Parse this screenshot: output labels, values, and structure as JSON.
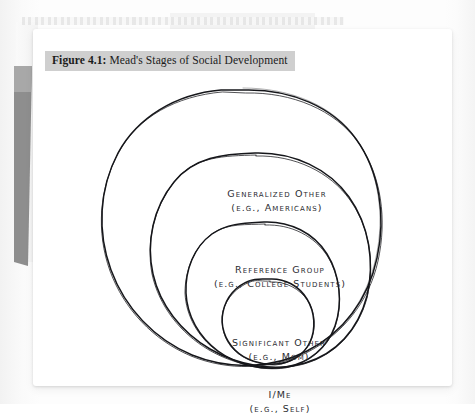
{
  "document": {
    "type": "textbook-page-scan",
    "page_background": "#ffffff",
    "scan_background": "#fdfdfd"
  },
  "caption": {
    "number": "Figure 4.1:",
    "title": "Mead's Stages of Social Development",
    "highlight_color": "#cfcfcf"
  },
  "diagram": {
    "style": "hand-drawn nested circles",
    "ink_color": "#15161a",
    "levels": [
      {
        "index": 1,
        "name": "generalized-other",
        "title": "Generalized Other",
        "example": "(e.g., Americans)",
        "ring": "outermost"
      },
      {
        "index": 2,
        "name": "reference-group",
        "title": "Reference Group",
        "example": "(e.g., College Students)",
        "ring": "second"
      },
      {
        "index": 3,
        "name": "significant-other",
        "title": "Significant Other",
        "example": "(e.g., Mom)",
        "ring": "third"
      },
      {
        "index": 4,
        "name": "i-me",
        "title": "I/Me",
        "example": "(e.g., Self)",
        "ring": "innermost"
      }
    ]
  },
  "page_artifacts": {
    "perforation_strip": "dashed-binding-strip",
    "page_edge_wedge": "#8e8e8e"
  }
}
